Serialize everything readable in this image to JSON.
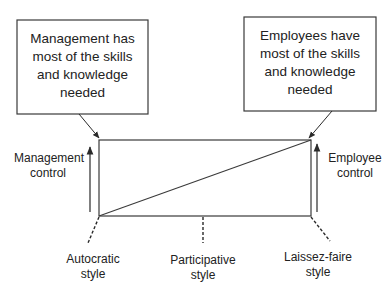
{
  "diagram": {
    "type": "leadership-style-continuum",
    "boxes": {
      "left": {
        "text": "Management has most of the skills and knowledge needed",
        "lines": [
          "Management has",
          "most of the skills",
          "and knowledge",
          "needed"
        ]
      },
      "right": {
        "text": "Employees have most of the skills and knowledge needed",
        "lines": [
          "Employees have",
          "most of the skills",
          "and knowledge",
          "needed"
        ]
      }
    },
    "axis_labels": {
      "left": {
        "lines": [
          "Management",
          "control"
        ]
      },
      "right": {
        "lines": [
          "Employee",
          "control"
        ]
      }
    },
    "styles": [
      {
        "name": "autocratic",
        "lines": [
          "Autocratic",
          "style"
        ]
      },
      {
        "name": "participative",
        "lines": [
          "Participative",
          "style"
        ]
      },
      {
        "name": "laissez-faire",
        "lines": [
          "Laissez-faire",
          "style"
        ]
      }
    ],
    "colors": {
      "line": "#3a3a3a",
      "text": "#222222",
      "background": "#ffffff"
    }
  }
}
